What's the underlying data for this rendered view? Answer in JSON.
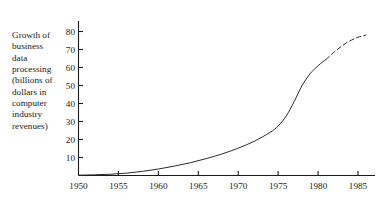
{
  "chart_data": {
    "type": "line",
    "title": "",
    "ylabel": "Growth of business data processing (billions of dollars in computer industry revenues)",
    "xlabel": "",
    "xlim": [
      1950,
      1987
    ],
    "ylim": [
      0,
      84
    ],
    "grid": false,
    "legend": "none",
    "x_ticks": [
      "1950",
      "1955",
      "1960",
      "1965",
      "1970",
      "1975",
      "1980",
      "1985"
    ],
    "x_tick_values": [
      1950,
      1955,
      1960,
      1965,
      1970,
      1975,
      1980,
      1985
    ],
    "y_ticks": [
      "10",
      "20",
      "30",
      "40",
      "50",
      "60",
      "70",
      "80"
    ],
    "y_tick_values": [
      10,
      20,
      30,
      40,
      50,
      60,
      70,
      80
    ],
    "axis_color": "#1a1a1a",
    "line_color": "#2b2b2b",
    "series": [
      {
        "name": "actual",
        "style": "solid",
        "x": [
          1950,
          1952,
          1954,
          1956,
          1958,
          1960,
          1962,
          1964,
          1966,
          1968,
          1970,
          1972,
          1974,
          1975,
          1976,
          1977,
          1978,
          1979,
          1980,
          1981
        ],
        "values": [
          0.2,
          0.4,
          0.7,
          1.3,
          2.3,
          3.6,
          5.2,
          7.1,
          9.4,
          12.0,
          15.2,
          19.0,
          24.0,
          27.5,
          33.0,
          41.0,
          50.0,
          56.5,
          61.0,
          64.5
        ]
      },
      {
        "name": "projected",
        "style": "dashed",
        "x": [
          1981,
          1982,
          1983,
          1984,
          1985,
          1986
        ],
        "values": [
          64.5,
          68.5,
          72.0,
          74.8,
          76.8,
          78.0
        ]
      }
    ]
  },
  "chart": {
    "y_axis_caption": "Growth of\nbusiness\ndata\nprocessing\n(billions of\ndollars in\ncomputer\nindustry\nrevenues)"
  }
}
